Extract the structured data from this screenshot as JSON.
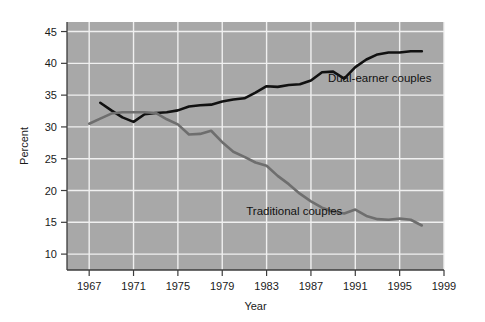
{
  "chart_data": {
    "type": "line",
    "title": "",
    "xlabel": "Year",
    "ylabel": "Percent",
    "xlim": [
      1965,
      1999
    ],
    "ylim": [
      7.5,
      46.5
    ],
    "yticks": [
      10,
      15,
      20,
      25,
      30,
      35,
      40,
      45
    ],
    "xticks": [
      1967,
      1971,
      1975,
      1979,
      1983,
      1987,
      1991,
      1995,
      1999
    ],
    "grid": true,
    "legend_position": "inline-annotations",
    "plot_background": "#a8a8a8",
    "gridline_color": "#f0f0f0",
    "axis_color": "#3c3c3c",
    "series": [
      {
        "name": "Dual-earner couples",
        "color": "#111111",
        "label_x": 1993.2,
        "label_y": 37.0,
        "x": [
          1968,
          1969,
          1970,
          1971,
          1972,
          1973,
          1974,
          1975,
          1976,
          1977,
          1978,
          1979,
          1980,
          1981,
          1982,
          1983,
          1984,
          1985,
          1986,
          1987,
          1988,
          1989,
          1990,
          1991,
          1992,
          1993,
          1994,
          1995,
          1996,
          1997
        ],
        "values": [
          33.8,
          32.6,
          31.5,
          30.8,
          32.0,
          32.2,
          32.3,
          32.6,
          33.2,
          33.4,
          33.5,
          34.0,
          34.3,
          34.5,
          35.4,
          36.4,
          36.3,
          36.6,
          36.7,
          37.3,
          38.6,
          38.7,
          37.6,
          39.4,
          40.6,
          41.4,
          41.7,
          41.7,
          41.9,
          41.9
        ]
      },
      {
        "name": "Traditional couples",
        "color": "#6e6e6e",
        "label_x": 1985.5,
        "label_y": 16.2,
        "x": [
          1967,
          1968,
          1969,
          1970,
          1971,
          1972,
          1973,
          1974,
          1975,
          1976,
          1977,
          1978,
          1979,
          1980,
          1981,
          1982,
          1983,
          1984,
          1985,
          1986,
          1987,
          1988,
          1989,
          1990,
          1991,
          1992,
          1993,
          1994,
          1995,
          1996,
          1997
        ],
        "values": [
          30.5,
          31.3,
          32.1,
          32.3,
          32.3,
          32.3,
          32.2,
          31.2,
          30.4,
          28.8,
          28.9,
          29.4,
          27.6,
          26.1,
          25.3,
          24.4,
          23.9,
          22.3,
          21.0,
          19.5,
          18.3,
          17.3,
          16.7,
          16.4,
          17.0,
          16.0,
          15.5,
          15.4,
          15.6,
          15.4,
          14.5
        ]
      }
    ]
  }
}
